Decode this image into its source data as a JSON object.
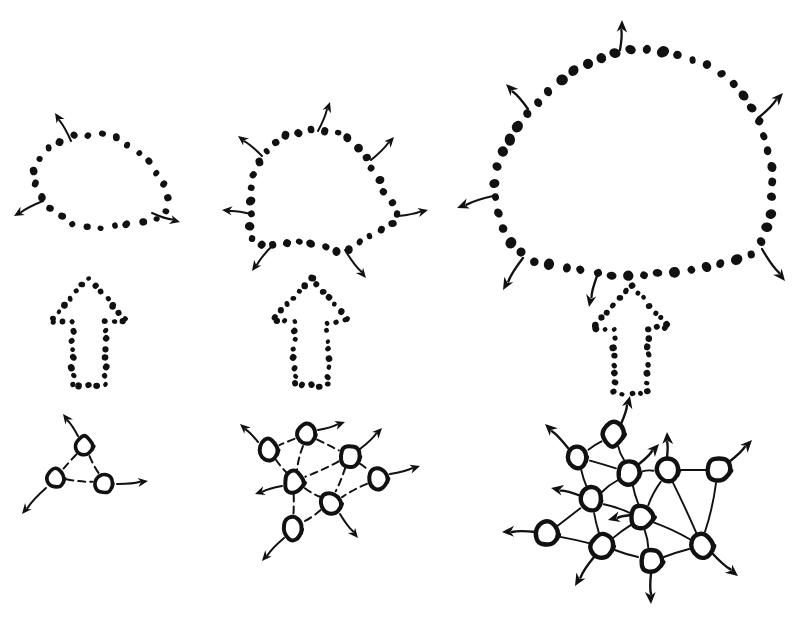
{
  "canvas": {
    "width": 794,
    "height": 618,
    "background": "#ffffff",
    "ink": "#111111"
  },
  "diagram": {
    "kind": "hand-drawn schematic",
    "rows": 3,
    "columns": 3,
    "column_labels": [
      "small",
      "medium",
      "large"
    ],
    "row_labels": [
      "dotted-blob-boundary",
      "dotted-outline-arrow",
      "node-link-network"
    ]
  },
  "blobs": [
    {
      "name": "blob-small",
      "dot_count": 26,
      "dot_radius": 3.6,
      "center": [
        101,
        183
      ],
      "radius_x": 68,
      "radius_y": 48,
      "outline": [
        [
          74,
          137
        ],
        [
          90,
          134
        ],
        [
          106,
          135
        ],
        [
          121,
          140
        ],
        [
          134,
          148
        ],
        [
          145,
          158
        ],
        [
          154,
          169
        ],
        [
          161,
          180
        ],
        [
          167,
          192
        ],
        [
          170,
          204
        ],
        [
          166,
          214
        ],
        [
          156,
          219
        ],
        [
          143,
          221
        ],
        [
          129,
          224
        ],
        [
          115,
          227
        ],
        [
          101,
          229
        ],
        [
          87,
          228
        ],
        [
          74,
          224
        ],
        [
          62,
          218
        ],
        [
          52,
          210
        ],
        [
          44,
          200
        ],
        [
          38,
          189
        ],
        [
          34,
          177
        ],
        [
          35,
          165
        ],
        [
          41,
          154
        ],
        [
          52,
          145
        ],
        [
          63,
          140
        ]
      ],
      "arrows": [
        {
          "from": [
            71,
            141
          ],
          "to": [
            55,
            113
          ],
          "name": "arrow-blob-small-nw"
        },
        {
          "from": [
            43,
            201
          ],
          "to": [
            14,
            216
          ],
          "name": "arrow-blob-small-w"
        },
        {
          "from": [
            152,
            213
          ],
          "to": [
            180,
            222
          ],
          "name": "arrow-blob-small-se"
        }
      ]
    },
    {
      "name": "blob-medium",
      "dot_count": 34,
      "dot_radius": 3.8,
      "center": [
        325,
        192
      ],
      "radius_x": 78,
      "radius_y": 62,
      "outline": [
        [
          286,
          135
        ],
        [
          302,
          131
        ],
        [
          318,
          130
        ],
        [
          333,
          132
        ],
        [
          346,
          137
        ],
        [
          356,
          145
        ],
        [
          364,
          155
        ],
        [
          371,
          166
        ],
        [
          377,
          177
        ],
        [
          383,
          188
        ],
        [
          389,
          199
        ],
        [
          395,
          209
        ],
        [
          399,
          218
        ],
        [
          393,
          225
        ],
        [
          383,
          229
        ],
        [
          373,
          234
        ],
        [
          363,
          240
        ],
        [
          354,
          247
        ],
        [
          345,
          252
        ],
        [
          333,
          250
        ],
        [
          321,
          246
        ],
        [
          309,
          243
        ],
        [
          297,
          242
        ],
        [
          285,
          243
        ],
        [
          273,
          245
        ],
        [
          262,
          246
        ],
        [
          253,
          243
        ],
        [
          250,
          233
        ],
        [
          250,
          221
        ],
        [
          251,
          208
        ],
        [
          252,
          195
        ],
        [
          252,
          182
        ],
        [
          257,
          168
        ],
        [
          265,
          155
        ],
        [
          275,
          143
        ]
      ],
      "arrows": [
        {
          "from": [
            318,
            131
          ],
          "to": [
            330,
            102
          ],
          "name": "arrow-blob-medium-n"
        },
        {
          "from": [
            371,
            160
          ],
          "to": [
            394,
            137
          ],
          "name": "arrow-blob-medium-ne"
        },
        {
          "from": [
            398,
            216
          ],
          "to": [
            428,
            210
          ],
          "name": "arrow-blob-medium-e"
        },
        {
          "from": [
            345,
            250
          ],
          "to": [
            366,
            278
          ],
          "name": "arrow-blob-medium-se"
        },
        {
          "from": [
            272,
            246
          ],
          "to": [
            252,
            271
          ],
          "name": "arrow-blob-medium-sw"
        },
        {
          "from": [
            251,
            214
          ],
          "to": [
            222,
            210
          ],
          "name": "arrow-blob-medium-w"
        },
        {
          "from": [
            262,
            156
          ],
          "to": [
            238,
            136
          ],
          "name": "arrow-blob-medium-nw"
        }
      ]
    },
    {
      "name": "blob-large",
      "dot_count": 52,
      "dot_radius": 4.6,
      "center": [
        634,
        160
      ],
      "radius_x": 143,
      "radius_y": 120,
      "outline": [
        [
          616,
          52
        ],
        [
          636,
          48
        ],
        [
          655,
          50
        ],
        [
          672,
          54
        ],
        [
          688,
          58
        ],
        [
          703,
          64
        ],
        [
          717,
          71
        ],
        [
          729,
          80
        ],
        [
          739,
          90
        ],
        [
          748,
          101
        ],
        [
          755,
          113
        ],
        [
          761,
          126
        ],
        [
          766,
          139
        ],
        [
          769,
          152
        ],
        [
          771,
          165
        ],
        [
          772,
          178
        ],
        [
          772,
          191
        ],
        [
          771,
          204
        ],
        [
          769,
          217
        ],
        [
          766,
          230
        ],
        [
          762,
          242
        ],
        [
          753,
          252
        ],
        [
          740,
          259
        ],
        [
          726,
          263
        ],
        [
          711,
          266
        ],
        [
          696,
          269
        ],
        [
          681,
          271
        ],
        [
          666,
          273
        ],
        [
          651,
          274
        ],
        [
          636,
          275
        ],
        [
          621,
          275
        ],
        [
          606,
          274
        ],
        [
          591,
          272
        ],
        [
          576,
          270
        ],
        [
          561,
          268
        ],
        [
          546,
          265
        ],
        [
          533,
          260
        ],
        [
          521,
          253
        ],
        [
          512,
          244
        ],
        [
          506,
          233
        ],
        [
          501,
          221
        ],
        [
          497,
          208
        ],
        [
          495,
          195
        ],
        [
          495,
          182
        ],
        [
          496,
          169
        ],
        [
          500,
          156
        ],
        [
          506,
          143
        ],
        [
          513,
          131
        ],
        [
          522,
          119
        ],
        [
          532,
          107
        ],
        [
          544,
          95
        ],
        [
          557,
          84
        ],
        [
          571,
          74
        ],
        [
          586,
          65
        ],
        [
          601,
          57
        ]
      ],
      "arrows": [
        {
          "from": [
            620,
            50
          ],
          "to": [
            622,
            20
          ],
          "name": "arrow-blob-large-n"
        },
        {
          "from": [
            528,
            109
          ],
          "to": [
            506,
            84
          ],
          "name": "arrow-blob-large-nw"
        },
        {
          "from": [
            758,
            118
          ],
          "to": [
            783,
            93
          ],
          "name": "arrow-blob-large-ne"
        },
        {
          "from": [
            493,
            196
          ],
          "to": [
            457,
            208
          ],
          "name": "arrow-blob-large-w"
        },
        {
          "from": [
            523,
            258
          ],
          "to": [
            503,
            290
          ],
          "name": "arrow-blob-large-sw"
        },
        {
          "from": [
            597,
            276
          ],
          "to": [
            589,
            307
          ],
          "name": "arrow-blob-large-s"
        },
        {
          "from": [
            762,
            249
          ],
          "to": [
            785,
            281
          ],
          "name": "arrow-blob-large-se"
        }
      ]
    }
  ],
  "growth_arrows": [
    {
      "name": "growth-arrow-small",
      "origin": [
        50,
        278
      ],
      "width": 78,
      "height": 108,
      "dot_radius": 2.9,
      "dot_count": 36,
      "direction": "up"
    },
    {
      "name": "growth-arrow-medium",
      "origin": [
        272,
        278
      ],
      "width": 78,
      "height": 108,
      "dot_radius": 2.9,
      "dot_count": 36,
      "direction": "up"
    },
    {
      "name": "growth-arrow-large",
      "origin": [
        592,
        285
      ],
      "width": 78,
      "height": 108,
      "dot_radius": 2.9,
      "dot_count": 36,
      "direction": "up"
    }
  ],
  "networks": [
    {
      "name": "network-small",
      "node_count": 3,
      "edge_count": 3,
      "node_radius": 9,
      "nodes": [
        {
          "id": "n1",
          "x": 84,
          "y": 446
        },
        {
          "id": "n2",
          "x": 55,
          "y": 478
        },
        {
          "id": "n3",
          "x": 104,
          "y": 483
        }
      ],
      "edges": [
        [
          "n1",
          "n2"
        ],
        [
          "n2",
          "n3"
        ],
        [
          "n3",
          "n1"
        ]
      ],
      "arrows": [
        {
          "from": [
            78,
            436
          ],
          "to": [
            63,
            414
          ],
          "name": "arrow-network-small-nw"
        },
        {
          "from": [
            46,
            488
          ],
          "to": [
            22,
            514
          ],
          "name": "arrow-network-small-sw"
        },
        {
          "from": [
            117,
            484
          ],
          "to": [
            148,
            481
          ],
          "name": "arrow-network-small-e"
        }
      ]
    },
    {
      "name": "network-medium",
      "node_count": 7,
      "edge_count": 10,
      "node_radius": 10,
      "nodes": [
        {
          "id": "m1",
          "x": 306,
          "y": 434
        },
        {
          "id": "m2",
          "x": 268,
          "y": 450
        },
        {
          "id": "m3",
          "x": 350,
          "y": 456
        },
        {
          "id": "m4",
          "x": 294,
          "y": 482
        },
        {
          "id": "m5",
          "x": 378,
          "y": 478
        },
        {
          "id": "m6",
          "x": 331,
          "y": 503
        },
        {
          "id": "m7",
          "x": 293,
          "y": 529
        }
      ],
      "edges": [
        [
          "m1",
          "m2"
        ],
        [
          "m1",
          "m3"
        ],
        [
          "m1",
          "m4"
        ],
        [
          "m2",
          "m4"
        ],
        [
          "m3",
          "m4"
        ],
        [
          "m3",
          "m5"
        ],
        [
          "m3",
          "m6"
        ],
        [
          "m4",
          "m6"
        ],
        [
          "m4",
          "m7"
        ],
        [
          "m6",
          "m7"
        ],
        [
          "m5",
          "m6"
        ]
      ],
      "arrows": [
        {
          "from": [
            318,
            430
          ],
          "to": [
            345,
            422
          ],
          "name": "arrow-network-medium-ne"
        },
        {
          "from": [
            258,
            442
          ],
          "to": [
            240,
            424
          ],
          "name": "arrow-network-medium-nw"
        },
        {
          "from": [
            360,
            449
          ],
          "to": [
            382,
            428
          ],
          "name": "arrow-network-medium-nne"
        },
        {
          "from": [
            390,
            474
          ],
          "to": [
            420,
            466
          ],
          "name": "arrow-network-medium-e"
        },
        {
          "from": [
            282,
            486
          ],
          "to": [
            255,
            494
          ],
          "name": "arrow-network-medium-w"
        },
        {
          "from": [
            340,
            514
          ],
          "to": [
            358,
            538
          ],
          "name": "arrow-network-medium-se"
        },
        {
          "from": [
            284,
            538
          ],
          "to": [
            262,
            561
          ],
          "name": "arrow-network-medium-sw"
        }
      ]
    },
    {
      "name": "network-large",
      "node_count": 11,
      "edge_count": 19,
      "node_radius": 11,
      "nodes": [
        {
          "id": "L1",
          "x": 613,
          "y": 434
        },
        {
          "id": "L2",
          "x": 577,
          "y": 457
        },
        {
          "id": "L3",
          "x": 629,
          "y": 472
        },
        {
          "id": "L4",
          "x": 667,
          "y": 470
        },
        {
          "id": "L5",
          "x": 719,
          "y": 470
        },
        {
          "id": "L6",
          "x": 591,
          "y": 500
        },
        {
          "id": "L7",
          "x": 642,
          "y": 517
        },
        {
          "id": "L8",
          "x": 547,
          "y": 534
        },
        {
          "id": "L9",
          "x": 602,
          "y": 546
        },
        {
          "id": "L10",
          "x": 651,
          "y": 561
        },
        {
          "id": "L11",
          "x": 702,
          "y": 545
        }
      ],
      "edges": [
        [
          "L1",
          "L2"
        ],
        [
          "L1",
          "L3"
        ],
        [
          "L2",
          "L3"
        ],
        [
          "L2",
          "L6"
        ],
        [
          "L3",
          "L4"
        ],
        [
          "L3",
          "L6"
        ],
        [
          "L3",
          "L7"
        ],
        [
          "L4",
          "L5"
        ],
        [
          "L4",
          "L7"
        ],
        [
          "L5",
          "L11"
        ],
        [
          "L6",
          "L7"
        ],
        [
          "L6",
          "L8"
        ],
        [
          "L6",
          "L9"
        ],
        [
          "L7",
          "L9"
        ],
        [
          "L7",
          "L10"
        ],
        [
          "L7",
          "L11"
        ],
        [
          "L8",
          "L9"
        ],
        [
          "L9",
          "L10"
        ],
        [
          "L10",
          "L11"
        ],
        [
          "L4",
          "L11"
        ]
      ],
      "arrows": [
        {
          "from": [
            621,
            424
          ],
          "to": [
            630,
            396
          ],
          "name": "arrow-network-large-n"
        },
        {
          "from": [
            568,
            448
          ],
          "to": [
            545,
            424
          ],
          "name": "arrow-network-large-nw"
        },
        {
          "from": [
            639,
            464
          ],
          "to": [
            659,
            444
          ],
          "name": "arrow-network-large-nne"
        },
        {
          "from": [
            667,
            458
          ],
          "to": [
            667,
            432
          ],
          "name": "arrow-network-large-n2"
        },
        {
          "from": [
            729,
            462
          ],
          "to": [
            752,
            440
          ],
          "name": "arrow-network-large-ne"
        },
        {
          "from": [
            581,
            496
          ],
          "to": [
            551,
            488
          ],
          "name": "arrow-network-large-w2"
        },
        {
          "from": [
            631,
            515
          ],
          "to": [
            608,
            520
          ],
          "name": "arrow-network-large-wint"
        },
        {
          "from": [
            536,
            532
          ],
          "to": [
            502,
            532
          ],
          "name": "arrow-network-large-w"
        },
        {
          "from": [
            594,
            557
          ],
          "to": [
            575,
            586
          ],
          "name": "arrow-network-large-sw"
        },
        {
          "from": [
            651,
            573
          ],
          "to": [
            651,
            604
          ],
          "name": "arrow-network-large-s"
        },
        {
          "from": [
            712,
            553
          ],
          "to": [
            738,
            576
          ],
          "name": "arrow-network-large-se"
        }
      ]
    }
  ]
}
